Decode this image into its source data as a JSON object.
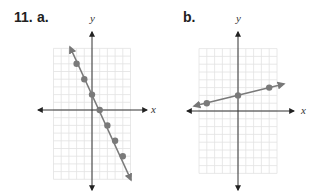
{
  "problem": {
    "number": "11.",
    "part_a": "a.",
    "part_b": "b."
  },
  "axes": {
    "x_label": "x",
    "y_label": "y"
  },
  "colors": {
    "line": "#7a7a7a",
    "point": "#7a7a7a",
    "axis": "#333333",
    "grid": "#e2e2e2"
  },
  "chart_data": [
    {
      "type": "line",
      "title": "a.",
      "xlabel": "x",
      "ylabel": "y",
      "grid": true,
      "xlim": [
        -5,
        5
      ],
      "ylim": [
        -9,
        8
      ],
      "equation": "y = -2x + 2",
      "points": [
        [
          -2,
          6
        ],
        [
          -1,
          4
        ],
        [
          0,
          2
        ],
        [
          1,
          0
        ],
        [
          2,
          -2
        ],
        [
          3,
          -4
        ],
        [
          4,
          -6
        ]
      ],
      "line_arrows": "both"
    },
    {
      "type": "line",
      "title": "b.",
      "xlabel": "x",
      "ylabel": "y",
      "grid": true,
      "xlim": [
        -5,
        5
      ],
      "ylim": [
        -8,
        8
      ],
      "equation": "y = 0.25x + 2",
      "points": [
        [
          -4,
          1
        ],
        [
          0,
          2
        ],
        [
          4,
          3
        ]
      ],
      "line_arrows": "both"
    }
  ]
}
